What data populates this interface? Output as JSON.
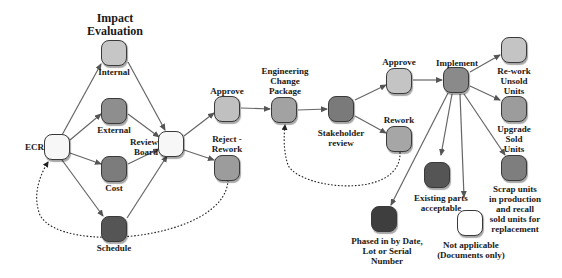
{
  "title": "Impact\nEvaluation",
  "colors": {
    "white": "#f7f7f7",
    "light": "#c8c8c8",
    "mid": "#9a9a9a",
    "dark": "#6a6a6a",
    "darker": "#4a4a4a",
    "edge": "#555555"
  },
  "nodes": {
    "ecr": {
      "label": "ECR"
    },
    "internal": {
      "label": "Internal"
    },
    "external": {
      "label": "External"
    },
    "cost": {
      "label": "Cost"
    },
    "schedule": {
      "label": "Schedule"
    },
    "review_board": {
      "label": "Review\nBoard"
    },
    "approve1": {
      "label": "Approve"
    },
    "reject": {
      "label": "Reject -\nRework"
    },
    "ecp": {
      "label": "Engineering\nChange\nPackage"
    },
    "stakeholder": {
      "label": "Stakeholder\nreview"
    },
    "approve2": {
      "label": "Approve"
    },
    "rework": {
      "label": "Rework"
    },
    "implement": {
      "label": "Implement"
    },
    "rework_unsold": {
      "label": "Re-work\nUnsold\nUnits"
    },
    "upgrade_sold": {
      "label": "Upgrade\nSold\nUnits"
    },
    "scrap": {
      "label": "Scrap units\nin production\nand recall\nsold units for\nreplacement"
    },
    "existing": {
      "label": "Existing parts\nacceptable"
    },
    "phased": {
      "label": "Phased in by Date,\nLot or Serial\nNumber"
    },
    "not_applicable": {
      "label": "Not applicable\n(Documents only)"
    }
  }
}
